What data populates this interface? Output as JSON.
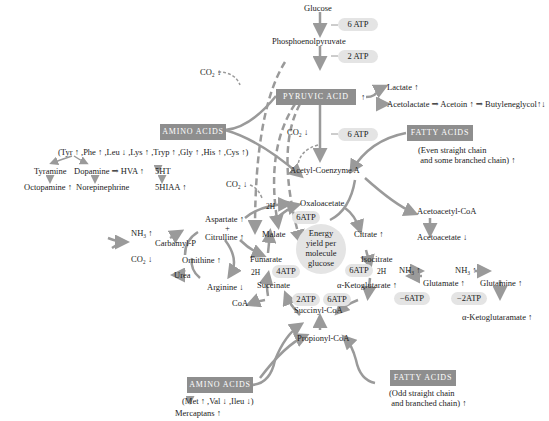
{
  "glycolysis": {
    "glucose": "Glucose",
    "atp1": "6 ATP",
    "pep": "Phosphoenolpyruvate",
    "atp2": "2 ATP",
    "pyruvic_acid": "PYRUVIC ACID",
    "pyruvic_arrow": "↑",
    "lactate": "Lactate ↑",
    "acetolactate_chain": "Acetolactate ⇒ Acetoin ↑ ⇒ Butyleneglycol↑↓",
    "co2_top": "CO₂ ↓",
    "co2_mid": "CO₂ ↓",
    "atp3": "6 ATP",
    "acetyl_coa": "Acetyl-Coenzyme A"
  },
  "amino_acids_top": {
    "label": "AMINO ACIDS",
    "list": "(Tyr ↑ ,Phe ↑ ,Leu ↓ ,Lys ↑ ,Tryp ↑ ,Gly ↑ ,His ↑ ,Cys ↑)",
    "tyramine": "Tyramine",
    "dopamine_chain": "Dopamine ⇒ HVA ↑",
    "octopamine": "Octopamine ↑",
    "norepinephrine": "Norepinephrine",
    "ht5": "5HT",
    "hiaa5": "5HIAA ↑",
    "co2": "CO₂ ↓"
  },
  "fatty_acids_top": {
    "label": "FATTY ACIDS",
    "desc_line1": "(Even straight chain",
    "desc_line2": " and some branched chain) ↑",
    "acetoacetyl_coa": "Acetoacetyl-CoA",
    "acetoacetate": "Acetoacetate ↓"
  },
  "tca_cycle": {
    "oxaloacetate": "Oxaloacetate",
    "atp_oxalo": "6ATP",
    "malate": "Malate",
    "h2_malate": "2H",
    "citrate": "Citrate ↑",
    "fumarate": "Fumarate",
    "isocitrate": "Isocitrate",
    "atp_fum": "4ATP",
    "h2_fum": "2H",
    "atp_iso": "6ATP",
    "h2_iso": "2H",
    "succinate": "Succinate",
    "akg": "α-Ketoglutarate ↑",
    "coa": "CoA",
    "atp_succ": "2ATP",
    "atp_akg": "6ATP",
    "succinyl_coa": "Succinyl-CoA",
    "propionyl_coa": "Propionyl-CoA",
    "center_line1": "Energy",
    "center_line2": "yield per",
    "center_line3": "molecule",
    "center_line4": "glucose"
  },
  "urea_cycle": {
    "aspartate": "Aspartate ↑",
    "plus": "+",
    "citrulline": "Citrulline ↑",
    "nh3": "NH₃ ↑",
    "carbamyl": "Carbamyl-P",
    "co2": "CO₂ ↓",
    "ornithine": "Ornithine ↑",
    "urea": "Urea",
    "arginine": "Arginine ↓"
  },
  "glutamate_branch": {
    "nh3_1": "NH₃ ↑",
    "glutamate": "Glutamate ↑",
    "atp_glu": "−6ATP",
    "nh3_2": "NH₃ ↑",
    "glutamine": "Glutamine ↑",
    "atp_gln": "−2ATP",
    "akg_amate": "α-Ketoglutaramate ↑"
  },
  "amino_acids_bottom": {
    "label": "AMINO ACIDS",
    "list": "(Met ↑ ,Val ↓ ,Ileu ↓)",
    "mercaptans": "Mercaptans ↑"
  },
  "fatty_acids_bottom": {
    "label": "FATTY ACIDS",
    "desc_line1": "(Odd straight chain",
    "desc_line2": " and branched chain) ↑"
  },
  "colors": {
    "box_fill": "#8e8e8e",
    "arrow": "#9a9a9a",
    "atp_fill": "#e4e4e4"
  }
}
